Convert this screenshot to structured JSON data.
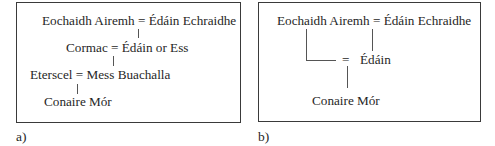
{
  "panel_a": {
    "label": "a)",
    "nodes": {
      "gen1": "Eochaidh Airemh = Édáin Echraidhe",
      "gen2": "Cormac = Édáin or Ess",
      "gen3": "Eterscel = Mess Buachalla",
      "gen4": "Conaire Mór"
    }
  },
  "panel_b": {
    "label": "b)",
    "nodes": {
      "gen1": "Eochaidh Airemh = Édáin Echraidhe",
      "gen2_eq": "=",
      "gen2": "Édáin",
      "gen3": "Conaire Mór"
    }
  }
}
